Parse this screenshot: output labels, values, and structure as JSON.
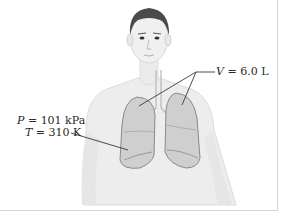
{
  "figure": {
    "labels": {
      "volume": {
        "symbol": "V",
        "equals": " = ",
        "value": "6.0 L"
      },
      "pressure": {
        "symbol": "P",
        "equals": " = ",
        "value": "101 kPa"
      },
      "temperature": {
        "symbol": "T",
        "equals": " = ",
        "value": "310 K"
      }
    },
    "colors": {
      "skin": "#ececec",
      "hair": "#4a4a4a",
      "lung_fill": "#cfcfcf",
      "lung_outline": "#8a8a8a",
      "leader_line": "#3a3a3a",
      "text": "#2a2a2a"
    }
  }
}
